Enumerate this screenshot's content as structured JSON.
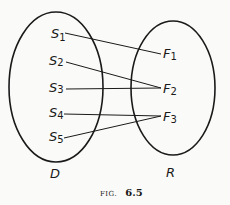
{
  "diagram": {
    "type": "function-mapping",
    "caption": {
      "prefix": "FIG.",
      "number": "6.5"
    },
    "domain": {
      "label": "D",
      "elements": [
        {
          "name": "S",
          "sub": "1"
        },
        {
          "name": "S",
          "sub": "2"
        },
        {
          "name": "S",
          "sub": "3"
        },
        {
          "name": "S",
          "sub": "4"
        },
        {
          "name": "S",
          "sub": "5"
        }
      ]
    },
    "range": {
      "label": "R",
      "elements": [
        {
          "name": "F",
          "sub": "1"
        },
        {
          "name": "F",
          "sub": "2"
        },
        {
          "name": "F",
          "sub": "3"
        }
      ]
    },
    "mappings": [
      {
        "from": "S1",
        "to": "F1"
      },
      {
        "from": "S2",
        "to": "F2"
      },
      {
        "from": "S3",
        "to": "F2"
      },
      {
        "from": "S4",
        "to": "F3"
      },
      {
        "from": "S5",
        "to": "F3"
      }
    ],
    "colors": {
      "ink": "#1a1a1a",
      "paper": "#fafaf8"
    }
  }
}
